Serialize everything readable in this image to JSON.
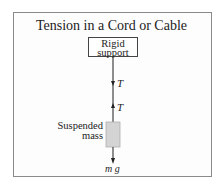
{
  "diagram": {
    "title": "Tension in a Cord or Cable",
    "support_label": [
      "Rigid",
      "support"
    ],
    "tension_upper_label": "T",
    "tension_lower_label": "T",
    "mass_label": [
      "Suspended",
      "mass"
    ],
    "weight_label": "m g",
    "colors": {
      "frame": "#8a8a8a",
      "cord": "#444444",
      "mass_fill": "#d4d4d4",
      "text": "#222222"
    }
  }
}
